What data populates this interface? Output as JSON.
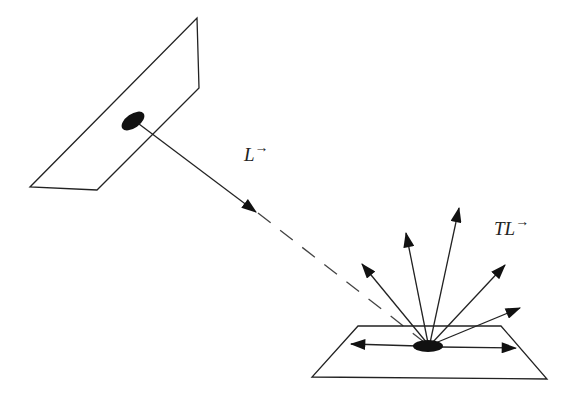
{
  "diagram": {
    "type": "light reflection diagram",
    "labels": {
      "incident": "L",
      "incident_vector_mark": "→",
      "reflected": "TL",
      "reflected_vector_mark": "→"
    },
    "colors": {
      "stroke": "#222222",
      "fill": "#111111",
      "background": "#ffffff"
    },
    "elements": [
      "source-plane",
      "source-spot",
      "incident-ray",
      "receiving-plane",
      "receiving-spot",
      "reflected-rays"
    ],
    "reflected_ray_count": 7
  }
}
